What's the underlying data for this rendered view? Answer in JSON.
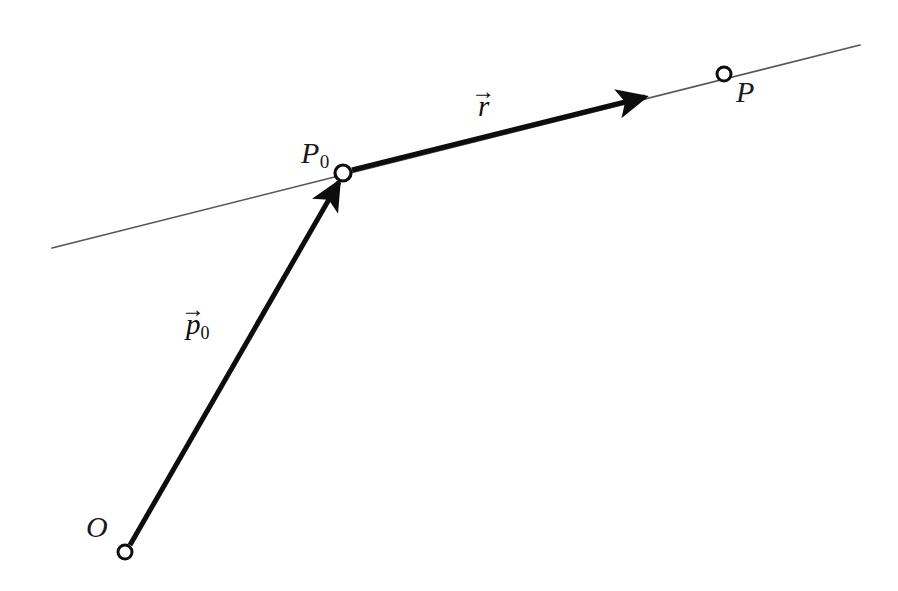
{
  "figure": {
    "kind": "vector-line-diagram",
    "background_color": "#ffffff",
    "ink_color": "#0d0d0d",
    "line_color": "#555555",
    "points": [
      {
        "id": "O",
        "label": "O",
        "subscript": "",
        "cx": 125,
        "cy": 552,
        "r": 7,
        "label_x": 86,
        "label_y": 512
      },
      {
        "id": "P0",
        "label": "P",
        "subscript": "0",
        "cx": 343,
        "cy": 173,
        "r": 8,
        "label_x": 301,
        "label_y": 138
      },
      {
        "id": "P",
        "label": "P",
        "subscript": "",
        "cx": 724,
        "cy": 74,
        "r": 7,
        "label_x": 736,
        "label_y": 77
      }
    ],
    "vectors": [
      {
        "id": "p0",
        "label_body": "p",
        "label_subscript": "0",
        "label_arrow": "→",
        "from": "O",
        "to": "P0",
        "x1": 130,
        "y1": 545,
        "x2": 339,
        "y2": 182,
        "stroke_width": 5,
        "label_x": 186,
        "label_y": 310
      },
      {
        "id": "r",
        "label_body": "r",
        "label_subscript": "",
        "label_arrow": "→",
        "from": "P0",
        "to": "P",
        "x1": 352,
        "y1": 170,
        "x2": 645,
        "y2": 97,
        "stroke_width": 5,
        "label_x": 478,
        "label_y": 92
      }
    ],
    "line": {
      "id": "infinite-line",
      "x1": 52,
      "y1": 248,
      "x2": 860,
      "y2": 45,
      "stroke_width": 1.6,
      "color": "#555555"
    }
  }
}
